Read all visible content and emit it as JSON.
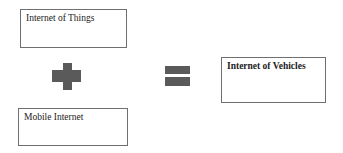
{
  "diagram": {
    "boxes": [
      {
        "id": "iot",
        "label": "Internet of Things",
        "bold": false
      },
      {
        "id": "mobile",
        "label": "Mobile Internet",
        "bold": false
      },
      {
        "id": "iov",
        "label": "Internet of Vehicles",
        "bold": true
      }
    ],
    "operators": [
      {
        "symbol": "plus-icon",
        "meaning": "+"
      },
      {
        "symbol": "equals-icon",
        "meaning": "="
      }
    ],
    "colors": {
      "operator": "#5a5a5a",
      "border": "#6f6f6f"
    }
  }
}
